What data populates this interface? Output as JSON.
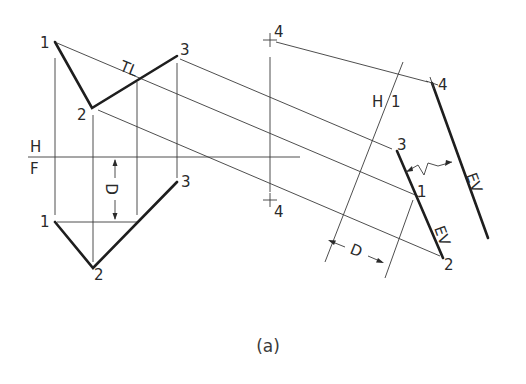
{
  "figure": {
    "caption": "(a)",
    "colors": {
      "line": "#3a3a3a",
      "object_line": "#1e1e1e",
      "background": "#ffffff"
    }
  },
  "fold_lines": {
    "hf": {
      "upper_label": "H",
      "lower_label": "F"
    },
    "h1": {
      "left_label": "H",
      "right_label": "1"
    }
  },
  "top_view": {
    "points": [
      {
        "id": "1",
        "label": "1"
      },
      {
        "id": "2",
        "label": "2"
      },
      {
        "id": "3",
        "label": "3"
      },
      {
        "id": "4",
        "label": "4"
      }
    ],
    "true_length_label": "TL"
  },
  "front_view": {
    "points": [
      {
        "id": "1",
        "label": "1"
      },
      {
        "id": "2",
        "label": "2"
      },
      {
        "id": "3",
        "label": "3"
      },
      {
        "id": "4",
        "label": "4"
      }
    ],
    "dimension_label": "D"
  },
  "auxiliary_view": {
    "points": [
      {
        "id": "1",
        "label": "1"
      },
      {
        "id": "2",
        "label": "2"
      },
      {
        "id": "3",
        "label": "3"
      },
      {
        "id": "4",
        "label": "4"
      }
    ],
    "edge_view_label_plane": "EV",
    "edge_view_label_line": "EV",
    "dimension_label": "D"
  }
}
